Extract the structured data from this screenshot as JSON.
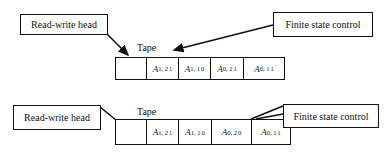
{
  "diagrams": [
    {
      "name": "turing-machine-before",
      "read_write_head_label": "Read-write head",
      "finite_state_control_label": "Finite state control",
      "tape_label": "Tape",
      "cells": [
        {
          "base": "",
          "sub": "",
          "sup": ""
        },
        {
          "base": "A",
          "sub": "1, 2",
          "sup": "1"
        },
        {
          "base": "A",
          "sub": "1, 1",
          "sup": "0"
        },
        {
          "base": "A",
          "sub": "0, 2",
          "sup": "1"
        },
        {
          "base": "A",
          "sub": "0, 1",
          "sup": "1"
        }
      ]
    },
    {
      "name": "turing-machine-after",
      "read_write_head_label": "Read-write head",
      "finite_state_control_label": "Finite state control",
      "tape_label": "Tape",
      "cells": [
        {
          "base": "",
          "sub": "",
          "sup": ""
        },
        {
          "base": "A",
          "sub": "1, 2",
          "sup": "1"
        },
        {
          "base": "A",
          "sub": "1, 1",
          "sup": "0"
        },
        {
          "base": "A",
          "sub": "0, 2",
          "sup": "0"
        },
        {
          "base": "A",
          "sub": "0, 1",
          "sup": "1"
        }
      ]
    }
  ]
}
